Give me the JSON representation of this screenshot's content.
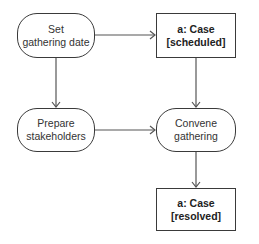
{
  "diagram": {
    "type": "uml-activity",
    "nodes": [
      {
        "id": "set-date",
        "kind": "action",
        "line1": "Set",
        "line2": "gathering date"
      },
      {
        "id": "case-scheduled",
        "kind": "object",
        "line1": "a: Case",
        "line2": "[scheduled]"
      },
      {
        "id": "prepare",
        "kind": "action",
        "line1": "Prepare",
        "line2": "stakeholders"
      },
      {
        "id": "convene",
        "kind": "action",
        "line1": "Convene",
        "line2": "gathering"
      },
      {
        "id": "case-resolved",
        "kind": "object",
        "line1": "a: Case",
        "line2": "[resolved]"
      }
    ],
    "edges": [
      {
        "from": "set-date",
        "to": "case-scheduled"
      },
      {
        "from": "set-date",
        "to": "prepare"
      },
      {
        "from": "case-scheduled",
        "to": "convene"
      },
      {
        "from": "prepare",
        "to": "convene"
      },
      {
        "from": "convene",
        "to": "case-resolved"
      }
    ]
  }
}
